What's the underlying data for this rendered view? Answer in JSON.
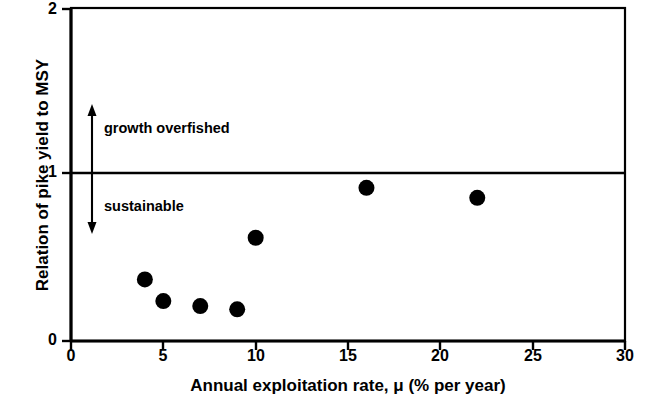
{
  "chart_data": {
    "type": "scatter",
    "title": "",
    "xlabel": "Annual exploitation rate, μ (% per year)",
    "ylabel": "Relation of pike yield to MSY",
    "xlim": [
      0,
      30
    ],
    "ylim": [
      0,
      2
    ],
    "xticks": [
      0,
      5,
      10,
      15,
      20,
      25,
      30
    ],
    "xtick_labels": [
      "0",
      "5",
      "10",
      "15",
      "20",
      "25",
      "30"
    ],
    "yticks": [
      0,
      1,
      2
    ],
    "ytick_labels": [
      "0",
      "1",
      "2"
    ],
    "grid": false,
    "legend": null,
    "series": [
      {
        "name": "pike yield relative to MSY",
        "marker": "filled-circle",
        "color": "#000000",
        "points": [
          {
            "x": 4,
            "y": 0.37
          },
          {
            "x": 5,
            "y": 0.24
          },
          {
            "x": 7,
            "y": 0.21
          },
          {
            "x": 9,
            "y": 0.19
          },
          {
            "x": 10,
            "y": 0.62
          },
          {
            "x": 16,
            "y": 0.92
          },
          {
            "x": 22,
            "y": 0.86
          }
        ]
      }
    ],
    "reference_lines": [
      {
        "name": "msy-threshold",
        "axis": "y",
        "value": 1,
        "color": "#000000",
        "width": 2.5
      }
    ],
    "annotations": [
      {
        "name": "growth-overfished",
        "text": "growth overfished",
        "arrow": "up",
        "arrow_x": 1.15,
        "arrow_from_y": 1.0,
        "arrow_to_y": 1.4,
        "text_x": 1.8,
        "text_y": 1.2
      },
      {
        "name": "sustainable",
        "text": "sustainable",
        "arrow": "down",
        "arrow_x": 1.15,
        "arrow_from_y": 1.0,
        "arrow_to_y": 0.65,
        "text_x": 1.8,
        "text_y": 0.83
      }
    ]
  },
  "axes": {
    "x_title": "Annual exploitation rate, μ (% per year)",
    "y_title": "Relation of pike yield to MSY",
    "x_tick_labels": [
      "0",
      "5",
      "10",
      "15",
      "20",
      "25",
      "30"
    ],
    "y_tick_labels": [
      "0",
      "1",
      "2"
    ]
  },
  "annotations": {
    "overfished_label": "growth overfished",
    "sustainable_label": "sustainable"
  },
  "colors": {
    "background": "#ffffff",
    "axis": "#000000",
    "marker": "#000000",
    "reference_line": "#000000"
  }
}
